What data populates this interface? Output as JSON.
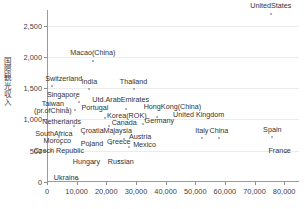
{
  "chart_data": {
    "type": "scatter",
    "title": "",
    "xlabel": "",
    "ylabel": "国際観光収入",
    "xlim": [
      0,
      85000
    ],
    "ylim": [
      0,
      2750
    ],
    "grid": true,
    "legend": "none",
    "xticks": [
      "0",
      "10,000",
      "20,000",
      "30,000",
      "40,000",
      "50,000",
      "60,000",
      "70,000",
      "80,000"
    ],
    "xtick_values": [
      0,
      10000,
      20000,
      30000,
      40000,
      50000,
      60000,
      70000,
      80000
    ],
    "yticks": [
      "0",
      "500",
      "1,000",
      "1,500",
      "2,000",
      "2,500"
    ],
    "ytick_values": [
      0,
      500,
      1000,
      1500,
      2000,
      2500
    ],
    "points": [
      {
        "label": "UnitedStates",
        "x": 75500,
        "y": 2690,
        "lx": 75500,
        "ly": 2690,
        "dx": 0,
        "dy": -4
      },
      {
        "label": "Macao(China)",
        "x": 15500,
        "y": 1930,
        "lx": 15500,
        "ly": 1930,
        "dx": 0,
        "dy": -4
      },
      {
        "label": "Switzerland",
        "x": 1600,
        "y": 1530,
        "lx": 1600,
        "ly": 1530,
        "dx": 12,
        "dy": -3
      },
      {
        "label": "India",
        "x": 14300,
        "y": 1490,
        "lx": 14300,
        "ly": 1490,
        "dx": 0,
        "dy": -3
      },
      {
        "label": "Thailand",
        "x": 29200,
        "y": 1490,
        "lx": 29200,
        "ly": 1490,
        "dx": 0,
        "dy": -3
      },
      {
        "label": "Singapore",
        "x": 9900,
        "y": 1340,
        "lx": 9900,
        "ly": 1340,
        "dx": -13,
        "dy": 1
      },
      {
        "label": "Utd.ArabEmirates",
        "x": 10700,
        "y": 1275,
        "lx": 10700,
        "ly": 1275,
        "dx": 42,
        "dy": 2
      },
      {
        "label": "Taiwan\n(pr.ofChina)",
        "x": 6700,
        "y": 1190,
        "lx": 6700,
        "ly": 1190,
        "dx": -14,
        "dy": 8
      },
      {
        "label": "Portugal",
        "x": 9400,
        "y": 1155,
        "lx": 9400,
        "ly": 1155,
        "dx": 20,
        "dy": 2
      },
      {
        "label": "HongKong(China)",
        "x": 26800,
        "y": 1175,
        "lx": 26800,
        "ly": 1175,
        "dx": 46,
        "dy": 2
      },
      {
        "label": "Korea(ROK)",
        "x": 19500,
        "y": 1025,
        "lx": 19500,
        "ly": 1025,
        "dx": 22,
        "dy": 2
      },
      {
        "label": "United Kingdom",
        "x": 37000,
        "y": 1045,
        "lx": 37000,
        "ly": 1045,
        "dx": 42,
        "dy": 2
      },
      {
        "label": "Netherlands",
        "x": 9000,
        "y": 900,
        "lx": 9000,
        "ly": 900,
        "dx": -12,
        "dy": 0
      },
      {
        "label": "Canada",
        "x": 21000,
        "y": 890,
        "lx": 21000,
        "ly": 890,
        "dx": 15,
        "dy": 1
      },
      {
        "label": "Germany",
        "x": 32500,
        "y": 930,
        "lx": 32500,
        "ly": 930,
        "dx": 16,
        "dy": 1
      },
      {
        "label": "Croatia",
        "x": 12500,
        "y": 760,
        "lx": 12500,
        "ly": 760,
        "dx": 8,
        "dy": 1
      },
      {
        "label": "Malaysia",
        "x": 22500,
        "y": 760,
        "lx": 22500,
        "ly": 760,
        "dx": 4,
        "dy": 1
      },
      {
        "label": "SouthAfrica",
        "x": 4000,
        "y": 720,
        "lx": 4000,
        "ly": 720,
        "dx": -5,
        "dy": 1
      },
      {
        "label": "Austria",
        "x": 26000,
        "y": 690,
        "lx": 26000,
        "ly": 690,
        "dx": 16,
        "dy": 2
      },
      {
        "label": "Italy",
        "x": 52200,
        "y": 700,
        "lx": 52200,
        "ly": 700,
        "dx": 0,
        "dy": -3
      },
      {
        "label": "China",
        "x": 58000,
        "y": 710,
        "lx": 58000,
        "ly": 710,
        "dx": 0,
        "dy": -3
      },
      {
        "label": "Spain",
        "x": 76000,
        "y": 720,
        "lx": 76000,
        "ly": 720,
        "dx": 0,
        "dy": -3
      },
      {
        "label": "Morocco",
        "x": 4800,
        "y": 605,
        "lx": 4800,
        "ly": 605,
        "dx": -4,
        "dy": 1
      },
      {
        "label": "Poland",
        "x": 14500,
        "y": 575,
        "lx": 14500,
        "ly": 575,
        "dx": 2,
        "dy": 2
      },
      {
        "label": "Greece",
        "x": 21500,
        "y": 600,
        "lx": 21500,
        "ly": 600,
        "dx": 8,
        "dy": 2
      },
      {
        "label": "Mexico",
        "x": 27500,
        "y": 555,
        "lx": 27500,
        "ly": 555,
        "dx": 16,
        "dy": 2
      },
      {
        "label": "Czech Republic",
        "x": 1300,
        "y": 500,
        "lx": 1300,
        "ly": 500,
        "dx": 8,
        "dy": 4
      },
      {
        "label": "France",
        "x": 80500,
        "y": 480,
        "lx": 80500,
        "ly": 480,
        "dx": -6,
        "dy": 3
      },
      {
        "label": "Hungary",
        "x": 16000,
        "y": 310,
        "lx": 16000,
        "ly": 310,
        "dx": -8,
        "dy": 3
      },
      {
        "label": "Russian",
        "x": 24200,
        "y": 330,
        "lx": 24200,
        "ly": 330,
        "dx": 2,
        "dy": 5
      },
      {
        "label": "Ukraine",
        "x": 10500,
        "y": 55,
        "lx": 10500,
        "ly": 55,
        "dx": -12,
        "dy": 3
      }
    ]
  },
  "colors": {
    "background": "#ffffff",
    "axis": "#9a9a9a",
    "grid": "#ececec",
    "point": "#9d9d9d",
    "text": "#333333"
  }
}
